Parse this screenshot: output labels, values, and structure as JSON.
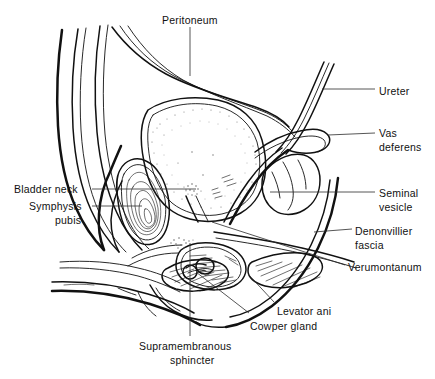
{
  "figure": {
    "type": "anatomical-diagram",
    "background_color": "#ffffff",
    "line_color": "#111111",
    "label_color": "#111111",
    "labels": [
      {
        "id": "peritoneum",
        "text": "Peritoneum",
        "x": 162,
        "y": 13,
        "align": "left",
        "leader": "vertical-down"
      },
      {
        "id": "ureter",
        "text": "Ureter",
        "x": 379,
        "y": 84,
        "align": "left",
        "leader": "horizontal-left"
      },
      {
        "id": "vas-deferens-line1",
        "text": "Vas",
        "x": 379,
        "y": 126,
        "align": "left",
        "leader": "horizontal-left"
      },
      {
        "id": "vas-deferens-line2",
        "text": "deferens",
        "x": 379,
        "y": 140,
        "align": "left",
        "leader": "none"
      },
      {
        "id": "bladder-neck",
        "text": "Bladder neck",
        "x": 14,
        "y": 182,
        "align": "left",
        "leader": "horizontal-right"
      },
      {
        "id": "symphysis-pubis-line1",
        "text": "Symphysis",
        "x": 29,
        "y": 199,
        "align": "left",
        "leader": "horizontal-right"
      },
      {
        "id": "symphysis-pubis-line2",
        "text": "pubis",
        "x": 55,
        "y": 213,
        "align": "left",
        "leader": "none"
      },
      {
        "id": "seminal-vesicle-line1",
        "text": "Seminal",
        "x": 379,
        "y": 186,
        "align": "left",
        "leader": "horizontal-left"
      },
      {
        "id": "seminal-vesicle-line2",
        "text": "vesicle",
        "x": 379,
        "y": 200,
        "align": "left",
        "leader": "none"
      },
      {
        "id": "denonvillier-line1",
        "text": "Denonvillier",
        "x": 355,
        "y": 224,
        "align": "left",
        "leader": "horizontal-left"
      },
      {
        "id": "denonvillier-line2",
        "text": "fascia",
        "x": 355,
        "y": 238,
        "align": "left",
        "leader": "none"
      },
      {
        "id": "verumontanum",
        "text": "Verumontanum",
        "x": 348,
        "y": 260,
        "align": "left",
        "leader": "horizontal-left"
      },
      {
        "id": "levator-ani",
        "text": "Levator ani",
        "x": 277,
        "y": 304,
        "align": "left",
        "leader": "diagonal"
      },
      {
        "id": "cowper-gland",
        "text": "Cowper gland",
        "x": 250,
        "y": 319,
        "align": "left",
        "leader": "diagonal"
      },
      {
        "id": "supramembranous-line1",
        "text": "Supramembranous",
        "x": 139,
        "y": 339,
        "align": "left",
        "leader": "vertical-up"
      },
      {
        "id": "supramembranous-line2",
        "text": "sphincter",
        "x": 170,
        "y": 353,
        "align": "left",
        "leader": "none"
      }
    ],
    "structures": [
      {
        "id": "abdominal-wall",
        "name": "Anterior abdominal wall"
      },
      {
        "id": "bladder",
        "name": "Urinary bladder"
      },
      {
        "id": "peritoneum-fold",
        "name": "Peritoneal reflection"
      },
      {
        "id": "symphysis-pubis",
        "name": "Symphysis pubis"
      },
      {
        "id": "prostate",
        "name": "Prostate gland"
      },
      {
        "id": "seminal-vesicle",
        "name": "Seminal vesicle"
      },
      {
        "id": "vas-deferens",
        "name": "Vas deferens"
      },
      {
        "id": "ureter",
        "name": "Ureter"
      },
      {
        "id": "rectum",
        "name": "Rectum"
      },
      {
        "id": "denonvillier-fascia",
        "name": "Denonvillier fascia"
      },
      {
        "id": "levator-ani",
        "name": "Levator ani muscle"
      },
      {
        "id": "cowper-gland",
        "name": "Cowper gland"
      },
      {
        "id": "urethra",
        "name": "Urethra / penis"
      },
      {
        "id": "verumontanum",
        "name": "Verumontanum"
      }
    ]
  }
}
